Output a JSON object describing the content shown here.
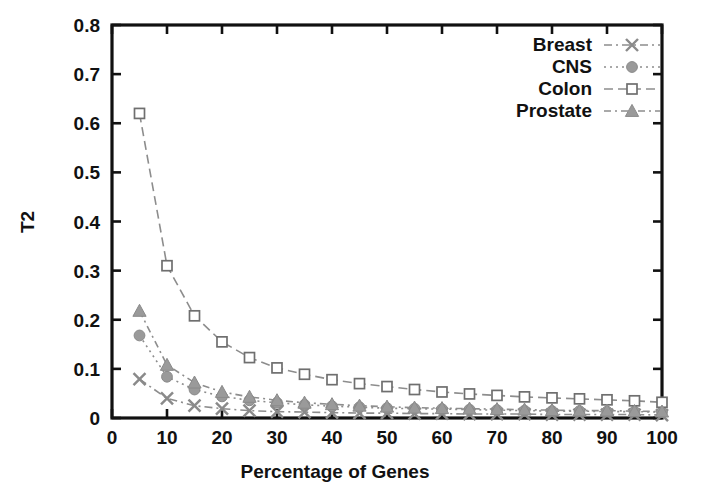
{
  "chart_data": {
    "type": "line",
    "title": "",
    "xlabel": "Percentage of Genes",
    "ylabel": "T2",
    "xlim": [
      0,
      100
    ],
    "ylim": [
      0,
      0.8
    ],
    "grid": false,
    "legend_position": "top-right",
    "xticks": [
      "0",
      "10",
      "20",
      "30",
      "40",
      "50",
      "60",
      "70",
      "80",
      "90",
      "100"
    ],
    "yticks": [
      "0",
      "0.1",
      "0.2",
      "0.3",
      "0.4",
      "0.5",
      "0.6",
      "0.7",
      "0.8"
    ],
    "x": [
      5,
      10,
      15,
      20,
      25,
      30,
      35,
      40,
      45,
      50,
      55,
      60,
      65,
      70,
      75,
      80,
      85,
      90,
      95,
      100
    ],
    "series": [
      {
        "name": "Breast",
        "marker": "cross",
        "color": "#8a8a8a",
        "values": [
          0.079,
          0.04,
          0.025,
          0.019,
          0.015,
          0.013,
          0.012,
          0.011,
          0.01,
          0.01,
          0.009,
          0.009,
          0.008,
          0.008,
          0.008,
          0.007,
          0.007,
          0.007,
          0.007,
          0.006
        ]
      },
      {
        "name": "CNS",
        "marker": "circle",
        "color": "#9a9a9a",
        "values": [
          0.168,
          0.084,
          0.058,
          0.044,
          0.036,
          0.031,
          0.027,
          0.024,
          0.022,
          0.02,
          0.019,
          0.018,
          0.017,
          0.016,
          0.015,
          0.014,
          0.014,
          0.013,
          0.013,
          0.012
        ]
      },
      {
        "name": "Colon",
        "marker": "square",
        "color": "#6f6f6f",
        "values": [
          0.62,
          0.31,
          0.208,
          0.155,
          0.123,
          0.102,
          0.089,
          0.078,
          0.07,
          0.064,
          0.058,
          0.053,
          0.049,
          0.046,
          0.043,
          0.041,
          0.039,
          0.037,
          0.035,
          0.032
        ]
      },
      {
        "name": "Prostate",
        "marker": "triangle",
        "color": "#9a9a9a",
        "values": [
          0.218,
          0.108,
          0.072,
          0.053,
          0.043,
          0.036,
          0.031,
          0.028,
          0.025,
          0.023,
          0.021,
          0.02,
          0.019,
          0.018,
          0.017,
          0.016,
          0.015,
          0.015,
          0.014,
          0.013
        ]
      }
    ]
  },
  "legend": {
    "items": [
      {
        "label": "Breast"
      },
      {
        "label": "CNS"
      },
      {
        "label": "Colon"
      },
      {
        "label": "Prostate"
      }
    ]
  },
  "axes": {
    "x_title": "Percentage of Genes",
    "y_title": "T2"
  }
}
